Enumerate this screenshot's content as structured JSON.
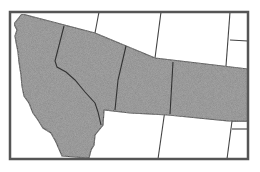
{
  "map": {
    "title": "Western United States",
    "highlighted_states": [
      "California",
      "Nevada",
      "Utah",
      "Colorado"
    ],
    "colors": {
      "highlight_fill": "#8a8a8a",
      "border": "#444444",
      "frame": "#555555",
      "background": "#ffffff"
    }
  }
}
